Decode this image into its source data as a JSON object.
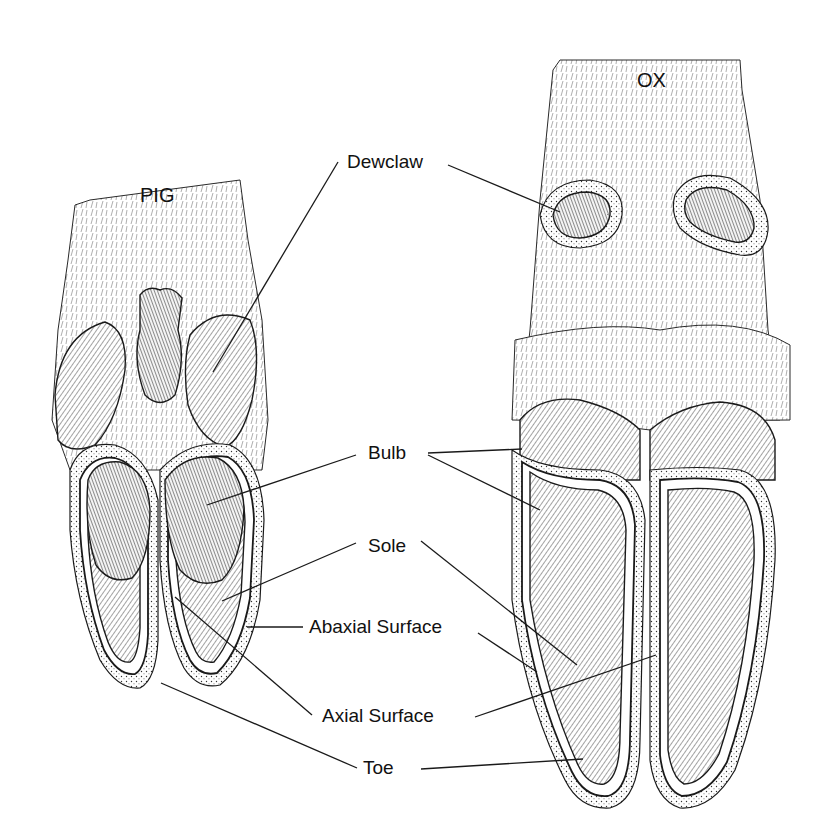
{
  "diagram": {
    "type": "anatomical-illustration",
    "specimens": [
      {
        "id": "pig",
        "title": "PIG",
        "title_pos": [
          140,
          185
        ]
      },
      {
        "id": "ox",
        "title": "OX",
        "title_pos": [
          637,
          70
        ]
      }
    ],
    "labels": [
      {
        "id": "dewclaw",
        "text": "Dewclaw",
        "pos": [
          347,
          152
        ],
        "leaders": [
          {
            "from": [
              338,
              162
            ],
            "to": [
              213,
              372
            ]
          },
          {
            "from": [
              448,
              165
            ],
            "to": [
              560,
              212
            ]
          }
        ]
      },
      {
        "id": "bulb",
        "text": "Bulb",
        "pos": [
          368,
          443
        ],
        "leaders": [
          {
            "from": [
              356,
              455
            ],
            "to": [
              207,
              505
            ]
          },
          {
            "from": [
              428,
              453
            ],
            "to": [
              522,
              449
            ]
          },
          {
            "from": [
              428,
              455
            ],
            "to": [
              540,
              510
            ]
          }
        ]
      },
      {
        "id": "sole",
        "text": "Sole",
        "pos": [
          368,
          536
        ],
        "leaders": [
          {
            "from": [
              356,
              543
            ],
            "to": [
              222,
              601
            ]
          },
          {
            "from": [
              421,
              541
            ],
            "to": [
              577,
              665
            ]
          }
        ]
      },
      {
        "id": "abaxial_surface",
        "text": "Abaxial Surface",
        "pos": [
          309,
          617
        ],
        "leaders": [
          {
            "from": [
              303,
              627
            ],
            "to": [
              247,
              627
            ]
          },
          {
            "from": [
              478,
              633
            ],
            "to": [
              537,
              672
            ]
          }
        ]
      },
      {
        "id": "axial_surface",
        "text": "Axial Surface",
        "pos": [
          322,
          706
        ],
        "leaders": [
          {
            "from": [
              312,
              715
            ],
            "to": [
              175,
              597
            ]
          },
          {
            "from": [
              475,
              717
            ],
            "to": [
              656,
              655
            ]
          }
        ]
      },
      {
        "id": "toe",
        "text": "Toe",
        "pos": [
          363,
          758
        ],
        "leaders": [
          {
            "from": [
              357,
              768
            ],
            "to": [
              161,
              683
            ]
          },
          {
            "from": [
              421,
              769
            ],
            "to": [
              583,
              759
            ]
          }
        ]
      }
    ]
  }
}
